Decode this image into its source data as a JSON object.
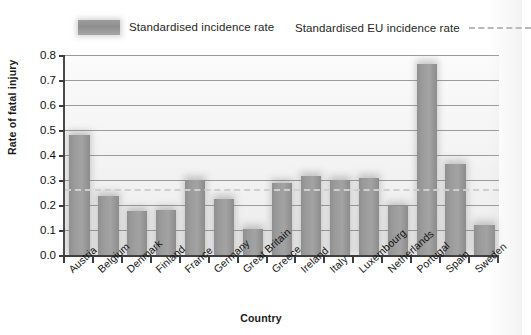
{
  "legend": {
    "bars_label": "Standardised incidence rate",
    "line_label": "Standardised EU incidence rate",
    "bar_swatch_color": "#9a9a9a",
    "line_color": "#cfcfcf"
  },
  "axes": {
    "ylabel": "Rate of fatal injury",
    "xlabel": "Country",
    "yticks": [
      "0.0",
      "0.1",
      "0.2",
      "0.3",
      "0.4",
      "0.5",
      "0.6",
      "0.7",
      "0.8"
    ]
  },
  "chart_data": {
    "type": "bar",
    "title": "",
    "xlabel": "Country",
    "ylabel": "Rate of fatal injury",
    "ylim": [
      0.0,
      0.8
    ],
    "ytick_step": 0.1,
    "grid": true,
    "legend_position": "top",
    "categories": [
      "Austria",
      "Belgium",
      "Denmark",
      "Finland",
      "France",
      "Germany",
      "Great Britain",
      "Greece",
      "Ireland",
      "Italy",
      "Luxembourg",
      "Netherlands",
      "Portugal",
      "Spain",
      "Sweden"
    ],
    "series": [
      {
        "name": "Standardised incidence rate",
        "values": [
          0.48,
          0.235,
          0.175,
          0.18,
          0.3,
          0.225,
          0.105,
          0.29,
          0.315,
          0.3,
          0.31,
          0.195,
          0.765,
          0.365,
          0.12
        ]
      }
    ],
    "reference_line": {
      "name": "Standardised EU incidence rate",
      "value": 0.265,
      "style": "dashed"
    }
  }
}
